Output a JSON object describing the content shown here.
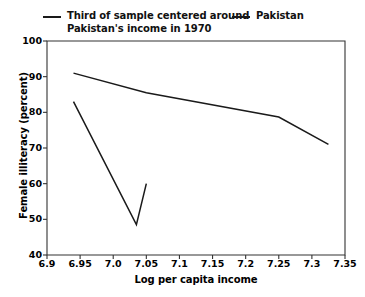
{
  "chart_data": {
    "type": "line",
    "title": "",
    "xlabel": "Log per capita income",
    "ylabel": "Female illiteracy (percent)",
    "xlim": [
      6.9,
      7.35
    ],
    "ylim": [
      40,
      100
    ],
    "grid": false,
    "legend_position": "top",
    "xticks": [
      "6.9",
      "6.95",
      "7.0",
      "7.05",
      "7.1",
      "7.15",
      "7.2",
      "7.25",
      "7.3",
      "7.35"
    ],
    "xtick_values": [
      6.9,
      6.95,
      7.0,
      7.05,
      7.1,
      7.15,
      7.2,
      7.25,
      7.3,
      7.35
    ],
    "yticks": [
      "40",
      "50",
      "60",
      "70",
      "80",
      "90",
      "100"
    ],
    "ytick_values": [
      40,
      50,
      60,
      70,
      80,
      90,
      100
    ],
    "line_color": "#1a1a1a",
    "series": [
      {
        "name": "Third of sample centered around\nPakistan's income in 1970",
        "x": [
          6.94,
          7.035,
          7.05
        ],
        "values": [
          83,
          48.5,
          60
        ]
      },
      {
        "name": "Pakistan",
        "x": [
          6.94,
          7.05,
          7.25,
          7.325
        ],
        "values": [
          91,
          85.5,
          78.7,
          71
        ]
      }
    ]
  },
  "legend": {
    "entries": [
      {
        "label": "Third of sample centered around\nPakistan's income in 1970"
      },
      {
        "label": "Pakistan"
      }
    ]
  },
  "axes": {
    "x_title": "Log per capita income",
    "y_title": "Female illiteracy (percent)"
  }
}
